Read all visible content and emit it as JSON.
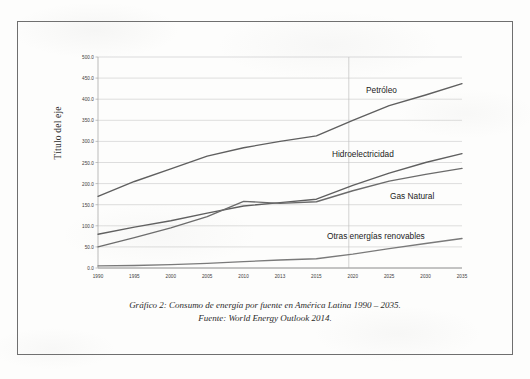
{
  "document": {
    "caption_line1": "Gráfico 2: Consumo de energía por fuente en América Latina 1990 – 2035.",
    "caption_line2": "Fuente: World Energy Outlook 2014."
  },
  "chart_data": {
    "type": "line",
    "title": "",
    "xlabel": "",
    "ylabel": "Título del eje",
    "ylim": [
      0,
      500
    ],
    "ytick_labels": [
      "500.0",
      "450.0",
      "400.0",
      "350.0",
      "300.0",
      "250.0",
      "200.0",
      "150.0",
      "100.0",
      "50.0",
      "0.0"
    ],
    "ytick_values": [
      500,
      450,
      400,
      350,
      300,
      250,
      200,
      150,
      100,
      50,
      0
    ],
    "grid": true,
    "legend_position": "inline-labels",
    "categories": [
      "1990",
      "1995",
      "2000",
      "2005",
      "2010",
      "2013",
      "2015",
      "2020",
      "2025",
      "2030",
      "2035"
    ],
    "series": [
      {
        "name": "Petróleo",
        "color": "#5f5f5f",
        "values": [
          170,
          205,
          235,
          265,
          285,
          300,
          313,
          350,
          385,
          410,
          437
        ]
      },
      {
        "name": "Hidroelectricidad",
        "color": "#5f5f5f",
        "values": [
          80,
          97,
          112,
          130,
          147,
          155,
          163,
          196,
          225,
          250,
          271
        ]
      },
      {
        "name": "Gas Natural",
        "color": "#6b6b6b",
        "values": [
          50,
          72,
          95,
          122,
          158,
          153,
          157,
          183,
          206,
          222,
          236
        ]
      },
      {
        "name": "Otras energías renovables",
        "color": "#7a7a7a",
        "values": [
          5,
          6,
          8,
          11,
          15,
          19,
          22,
          33,
          46,
          58,
          70
        ]
      }
    ],
    "series_label_positions": [
      {
        "name": "Petróleo",
        "x": 366,
        "y": 85
      },
      {
        "name": "Hidroelectricidad",
        "x": 332,
        "y": 149
      },
      {
        "name": "Gas Natural",
        "x": 390,
        "y": 191
      },
      {
        "name": "Otras energías renovables",
        "x": 327,
        "y": 231
      }
    ]
  }
}
